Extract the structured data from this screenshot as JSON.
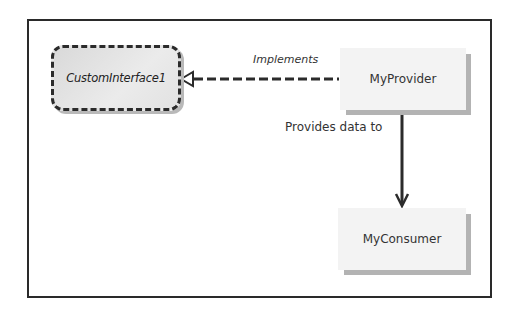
{
  "diagram": {
    "nodes": {
      "interface": {
        "label": "CustomInterface1",
        "kind": "interface"
      },
      "provider": {
        "label": "MyProvider",
        "kind": "class"
      },
      "consumer": {
        "label": "MyConsumer",
        "kind": "class"
      }
    },
    "edges": {
      "implements": {
        "label": "Implements",
        "from": "MyProvider",
        "to": "CustomInterface1",
        "style": "dashed-hollow-arrow"
      },
      "provides": {
        "label": "Provides data to",
        "from": "MyProvider",
        "to": "MyConsumer",
        "style": "solid-arrow"
      }
    },
    "colors": {
      "line": "#2b2b2b",
      "class_fill": "#f3f3f3",
      "shadow": "#b3b3b3",
      "interface_fill": "#e0e0e0"
    }
  }
}
